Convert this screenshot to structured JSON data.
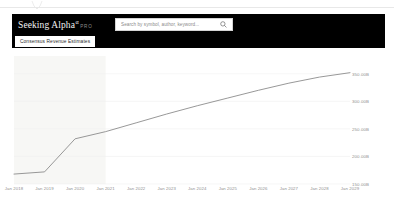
{
  "header": {
    "brand_name": "Seeking Alpha",
    "brand_alpha_glyph": "α",
    "brand_pro": "PRO",
    "logo_icon": "seeking-alpha-logo",
    "search": {
      "placeholder": "Search by symbol, author, keyword...",
      "value": "",
      "icon": "search-icon"
    }
  },
  "subheader": {
    "active_tab": "Consensus Revenue Estimates"
  },
  "cursor": {
    "icon": "cursor-artifact"
  },
  "colors": {
    "header_bg": "#000000",
    "tab_bg": "#ffffff",
    "line": "#8c8c8c",
    "shaded_band": "#f7f7f5",
    "axis_text": "#8f8f8f",
    "gridline": "#f0f0f0"
  },
  "chart_data": {
    "type": "line",
    "title": "Consensus Revenue Estimates",
    "xlabel": "",
    "ylabel": "",
    "grid": true,
    "legend": "none",
    "ylim": [
      150,
      375
    ],
    "ytick_labels": [
      "350.00B",
      "300.00B",
      "250.00B",
      "200.00B",
      "150.00B"
    ],
    "ytick_values": [
      350,
      300,
      250,
      200,
      150
    ],
    "categories": [
      "Jan 2018",
      "Jan 2019",
      "Jan 2020",
      "Jan 2021",
      "Jan 2022",
      "Jan 2023",
      "Jan 2024",
      "Jan 2025",
      "Jan 2026",
      "Jan 2027",
      "Jan 2028",
      "Jan 2029"
    ],
    "series": [
      {
        "name": "Revenue",
        "values": [
          168,
          172,
          232,
          245,
          261,
          277,
          292,
          306,
          320,
          333,
          344,
          352
        ]
      }
    ],
    "shaded_region": {
      "from": "Jan 2018",
      "to": "Jan 2021",
      "label": "actuals"
    }
  }
}
